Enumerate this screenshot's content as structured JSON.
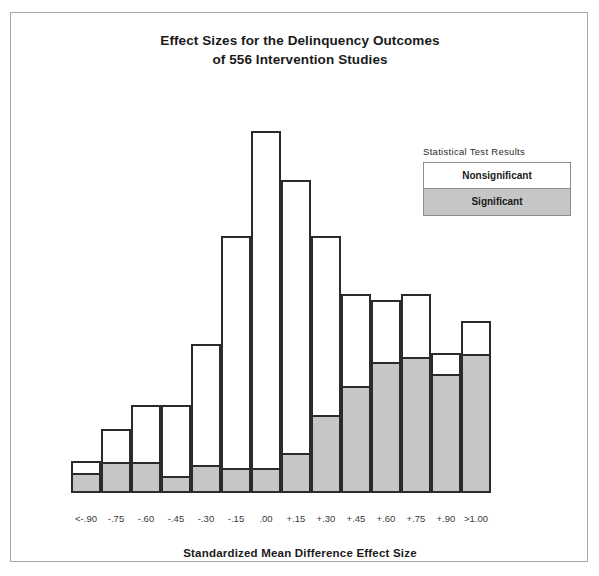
{
  "chart_data": {
    "type": "bar",
    "title": "Effect Sizes for the Delinquency Outcomes of 556 Intervention Studies",
    "title_line1": "Effect Sizes for the Delinquency Outcomes",
    "title_line2": "of 556 Intervention Studies",
    "xlabel": "Standardized Mean Difference Effect Size",
    "ylabel": "",
    "grid": false,
    "stacked": true,
    "legend_position": "top-right",
    "legend_title": "Statistical Test Results",
    "categories": [
      "<-.90",
      "-.75",
      "-.60",
      "-.45",
      "-.30",
      "-.15",
      ".00",
      "+.15",
      "+.30",
      "+.45",
      "+.60",
      "+.75",
      "+.90",
      ">1.00"
    ],
    "series": [
      {
        "name": "Nonsignificant",
        "color": "#ffffff",
        "values": [
          5,
          12,
          20,
          25,
          42,
          80,
          116,
          94,
          62,
          32,
          22,
          22,
          8,
          12
        ]
      },
      {
        "name": "Significant",
        "color": "#c6c6c6",
        "values": [
          6,
          10,
          10,
          5,
          9,
          8,
          8,
          13,
          26,
          36,
          44,
          46,
          40,
          47
        ]
      }
    ],
    "totals": [
      11,
      22,
      30,
      30,
      51,
      88,
      124,
      107,
      88,
      68,
      66,
      68,
      48,
      59
    ],
    "ylim": [
      0,
      130
    ]
  },
  "legend": {
    "title": "Statistical Test Results",
    "nonsignificant_label": "Nonsignificant",
    "significant_label": "Significant",
    "nonsignificant_color": "#ffffff",
    "significant_color": "#c6c6c6"
  },
  "axis": {
    "x_title": "Standardized Mean Difference Effect Size",
    "ticks": [
      "<-.90",
      "-.75",
      "-.60",
      "-.45",
      "-.30",
      "-.15",
      ".00",
      "+.15",
      "+.30",
      "+.45",
      "+.60",
      "+.75",
      "+.90",
      ">1.00"
    ]
  },
  "colors": {
    "frame_border": "#a8a8a8",
    "bar_outline": "#2b2b2b",
    "significant_fill": "#c6c6c6",
    "nonsignificant_fill": "#ffffff",
    "text": "#1a1a1a"
  }
}
